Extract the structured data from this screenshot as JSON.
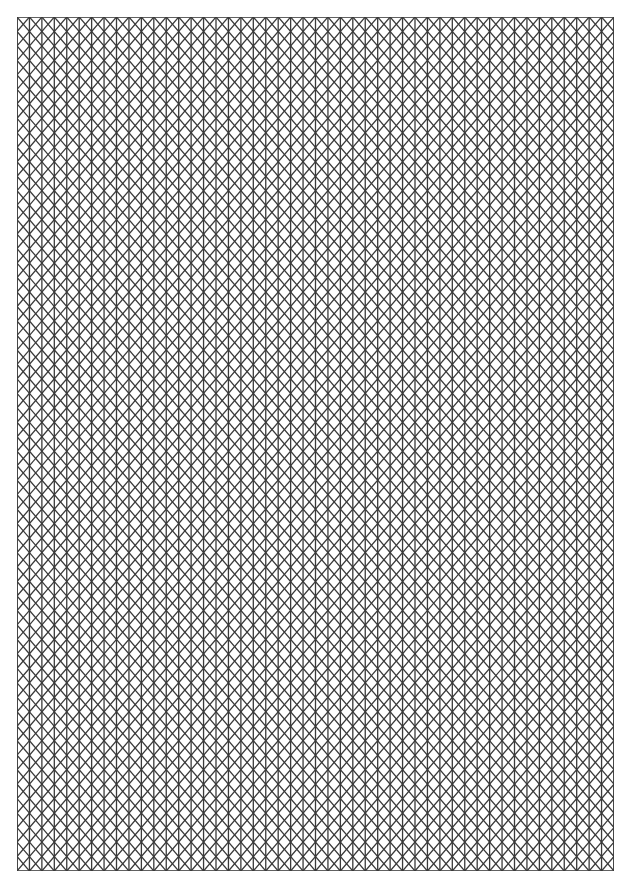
{
  "document": {
    "title": "Isometric Triangle Graph Paper",
    "page_width": 632,
    "page_height": 890,
    "background_color": "#ffffff"
  },
  "grid": {
    "name": "isometric-triangle-grid",
    "pattern": "triangular",
    "origin_x": 17,
    "origin_y": 17,
    "width": 597,
    "height": 854,
    "cell_width": 24.875,
    "row_height": 14.4745,
    "columns": 24,
    "rows": 59,
    "line_color": "#3a3a3a",
    "line_width": 1.3,
    "border_color": "#3a3a3a",
    "border_width": 1.6,
    "fill_color": "#ffffff",
    "has_vertical_lines": true,
    "has_diagonal_up_lines": true,
    "has_diagonal_down_lines": true,
    "has_horizontal_lines": false
  },
  "chart_data": {
    "type": "table",
    "xlabel": "",
    "ylabel": "",
    "categories": [],
    "values": [],
    "grid": "on",
    "legend": "none"
  }
}
